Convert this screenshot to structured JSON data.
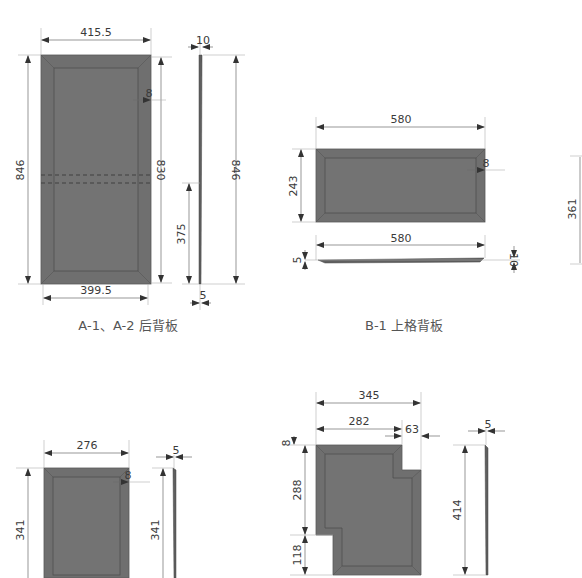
{
  "drawing": {
    "colors": {
      "panel_fill": "#6f6f6f",
      "panel_inner": "#737373",
      "dimension_line": "#6a6a6a",
      "text": "#3a3a3a",
      "caption": "#555555",
      "background": "#ffffff"
    },
    "part_a": {
      "caption": "A-1、A-2 后背板",
      "front": {
        "top_width": "415.5",
        "bottom_width": "399.5",
        "height": "846",
        "inner_height": "830",
        "bevel": "8"
      },
      "side": {
        "top_thickness": "10",
        "bottom_thickness": "5",
        "height": "846",
        "lower_height": "375"
      }
    },
    "part_b": {
      "caption": "B-1 上格背板",
      "front": {
        "width": "580",
        "height": "243",
        "bevel": "8"
      },
      "edge_view": {
        "width": "580",
        "left_thickness": "5",
        "right_thickness": "10"
      },
      "partial_dimension": "361"
    },
    "part_c": {
      "front": {
        "width": "276",
        "height": "341",
        "bevel": "8"
      },
      "side": {
        "thickness": "5",
        "height": "341"
      }
    },
    "part_d": {
      "front": {
        "total_width": "345",
        "upper_width": "282",
        "notch_width": "63",
        "top_offset": "8",
        "upper_height": "288",
        "lower_notch_height": "118"
      },
      "side": {
        "thickness": "5",
        "height": "414"
      }
    }
  }
}
